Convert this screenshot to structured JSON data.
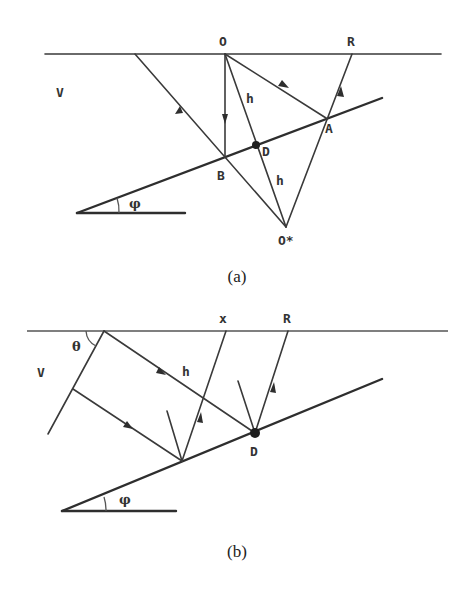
{
  "figure_a": {
    "caption": "(a)",
    "labels": {
      "source": "O",
      "receiver": "R",
      "velocity": "V",
      "reflection_point_A": "A",
      "reflection_point_B": "B",
      "diffractor": "D",
      "image_source": "O*",
      "distance_upper": "h",
      "distance_lower": "h",
      "dip_angle": "φ"
    }
  },
  "figure_b": {
    "caption": "(b)",
    "labels": {
      "offset": "x",
      "receiver": "R",
      "velocity": "V",
      "incidence_angle": "θ",
      "distance": "h",
      "diffractor": "D",
      "dip_angle": "φ"
    }
  }
}
